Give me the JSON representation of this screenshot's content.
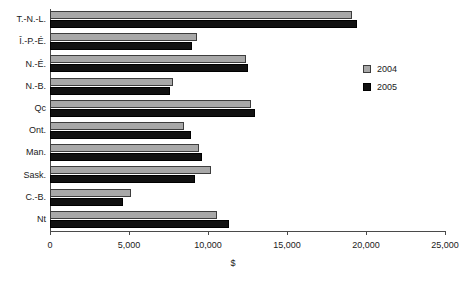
{
  "chart_data": {
    "type": "bar",
    "orientation": "horizontal",
    "title": "",
    "xlabel": "$",
    "ylabel": "",
    "xlim": [
      0,
      25000
    ],
    "xticks": [
      0,
      5000,
      10000,
      15000,
      20000,
      25000
    ],
    "xtick_labels": [
      "0",
      "5,000",
      "10,000",
      "15,000",
      "20,000",
      "25,000"
    ],
    "grid": false,
    "legend_position": "right",
    "categories": [
      "T.-N.-L.",
      "Î.-P.-É.",
      "N.-É.",
      "N.-B.",
      "Qc",
      "Ont.",
      "Man.",
      "Sask.",
      "C.-B.",
      "Nt"
    ],
    "series": [
      {
        "name": "2004",
        "color": "#a8a8a8",
        "values": [
          19100,
          9300,
          12400,
          7800,
          12700,
          8500,
          9400,
          10200,
          5100,
          10600
        ]
      },
      {
        "name": "2005",
        "color": "#111111",
        "values": [
          19400,
          9000,
          12500,
          7600,
          13000,
          8900,
          9600,
          9200,
          4600,
          11300
        ]
      }
    ]
  },
  "legend": {
    "items": [
      {
        "label": "2004"
      },
      {
        "label": "2005"
      }
    ]
  },
  "axis": {
    "x_title": "$"
  }
}
